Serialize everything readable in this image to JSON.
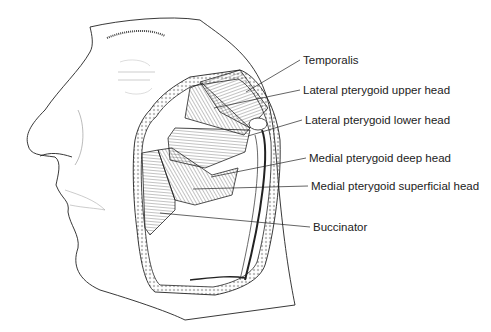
{
  "diagram": {
    "labels": [
      {
        "id": "temporalis",
        "text": "Temporalis",
        "x": 303,
        "y": 55,
        "tx": 246,
        "ty": 92
      },
      {
        "id": "lat-ptery-upper",
        "text": "Lateral pterygoid upper head",
        "x": 303,
        "y": 88,
        "tx": 214,
        "ty": 108
      },
      {
        "id": "lat-ptery-lower",
        "text": "Lateral pterygoid lower head",
        "x": 305,
        "y": 118,
        "tx": 248,
        "ty": 136
      },
      {
        "id": "med-ptery-deep",
        "text": "Medial pterygoid deep head",
        "x": 309,
        "y": 155,
        "tx": 211,
        "ty": 177
      },
      {
        "id": "med-ptery-superficial",
        "text": "Medial pterygoid superficial head",
        "x": 311,
        "y": 182,
        "tx": 193,
        "ty": 189
      },
      {
        "id": "buccinator",
        "text": "Buccinator",
        "x": 313,
        "y": 223,
        "tx": 160,
        "ty": 213
      }
    ],
    "colors": {
      "line": "#222222",
      "text": "#222222",
      "background": "#ffffff"
    }
  }
}
